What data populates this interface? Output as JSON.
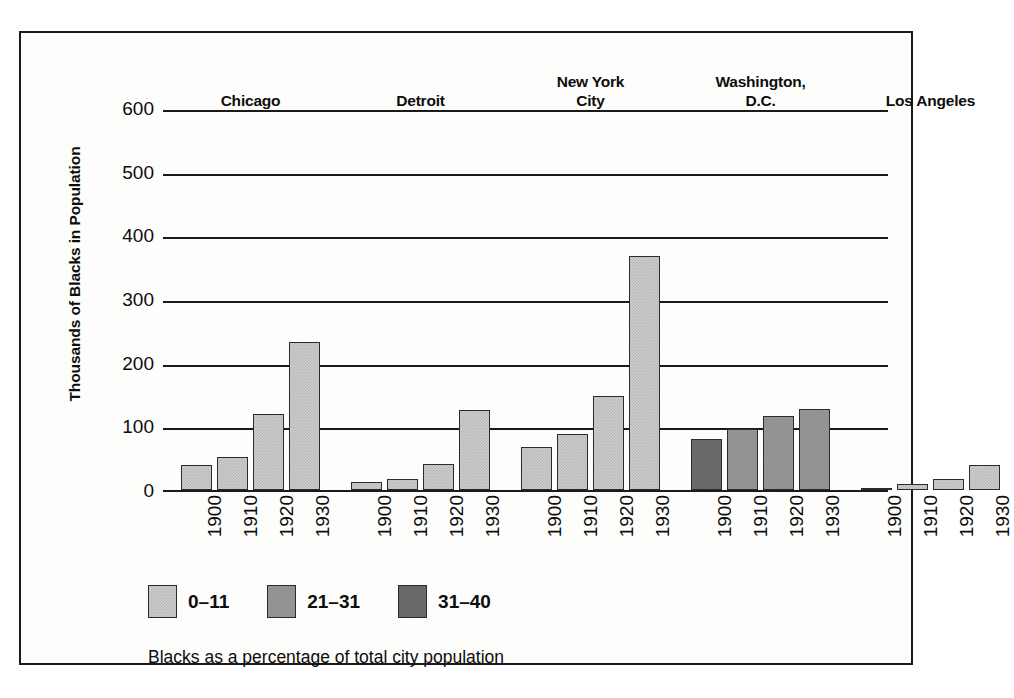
{
  "chart_data": {
    "type": "bar",
    "title": "",
    "xlabel": "",
    "ylabel": "Thousands of Blacks in Population",
    "ylim": [
      0,
      600
    ],
    "ytick_labels": [
      "600",
      "500",
      "400",
      "300",
      "200",
      "100",
      "0"
    ],
    "ytick_values": [
      600,
      500,
      400,
      300,
      200,
      100,
      0
    ],
    "grid": true,
    "legend_position": "bottom-left",
    "categories": [
      "1900",
      "1910",
      "1920",
      "1930"
    ],
    "groups": [
      {
        "name": "Chicago",
        "label_lines": [
          "Chicago"
        ],
        "bars": [
          {
            "year": "1900",
            "value": 40,
            "shade": "light"
          },
          {
            "year": "1910",
            "value": 52,
            "shade": "light"
          },
          {
            "year": "1920",
            "value": 120,
            "shade": "light"
          },
          {
            "year": "1930",
            "value": 232,
            "shade": "light"
          }
        ]
      },
      {
        "name": "Detroit",
        "label_lines": [
          "Detroit"
        ],
        "bars": [
          {
            "year": "1900",
            "value": 12,
            "shade": "light"
          },
          {
            "year": "1910",
            "value": 18,
            "shade": "light"
          },
          {
            "year": "1920",
            "value": 41,
            "shade": "light"
          },
          {
            "year": "1930",
            "value": 125,
            "shade": "light"
          }
        ]
      },
      {
        "name": "New York City",
        "label_lines": [
          "New York",
          "City"
        ],
        "bars": [
          {
            "year": "1900",
            "value": 68,
            "shade": "light"
          },
          {
            "year": "1910",
            "value": 88,
            "shade": "light"
          },
          {
            "year": "1920",
            "value": 148,
            "shade": "light"
          },
          {
            "year": "1930",
            "value": 368,
            "shade": "light"
          }
        ]
      },
      {
        "name": "Washington, D.C.",
        "label_lines": [
          "Washington,",
          "D.C."
        ],
        "bars": [
          {
            "year": "1900",
            "value": 80,
            "shade": "dark"
          },
          {
            "year": "1910",
            "value": 96,
            "shade": "medium"
          },
          {
            "year": "1920",
            "value": 116,
            "shade": "medium"
          },
          {
            "year": "1930",
            "value": 128,
            "shade": "medium"
          }
        ]
      },
      {
        "name": "Los Angeles",
        "label_lines": [
          "Los Angeles"
        ],
        "bars": [
          {
            "year": "1900",
            "value": 3,
            "shade": "light"
          },
          {
            "year": "1910",
            "value": 10,
            "shade": "light"
          },
          {
            "year": "1920",
            "value": 18,
            "shade": "light"
          },
          {
            "year": "1930",
            "value": 39,
            "shade": "light"
          }
        ]
      }
    ],
    "legend": {
      "entries": [
        {
          "label": "0–11",
          "shade": "light",
          "color": "#cdcdcd"
        },
        {
          "label": "21–31",
          "shade": "medium",
          "color": "#9a9a9a"
        },
        {
          "label": "31–40",
          "shade": "dark",
          "color": "#6e6e6e"
        }
      ],
      "caption": "Blacks as a percentage of total city population"
    }
  }
}
